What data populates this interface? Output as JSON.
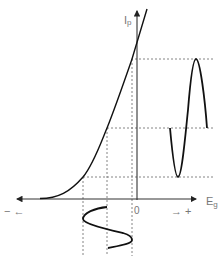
{
  "diagram": {
    "y_axis_label": "Ip",
    "y_axis_label_main": "I",
    "y_axis_label_sub": "p",
    "x_axis_label_main": "E",
    "x_axis_label_sub": "g",
    "origin_label": "0",
    "negative_direction_label": "−  ←",
    "positive_direction_label": "→  +",
    "colors": {
      "curve": "#111111",
      "axis": "#333333",
      "dashed": "#666666",
      "label": "#777777"
    },
    "elements": [
      "transfer-curve",
      "input-grid-signal (sine, below Eg axis)",
      "output-plate-signal (sine, right of Ip axis)",
      "projection dashed lines"
    ]
  }
}
